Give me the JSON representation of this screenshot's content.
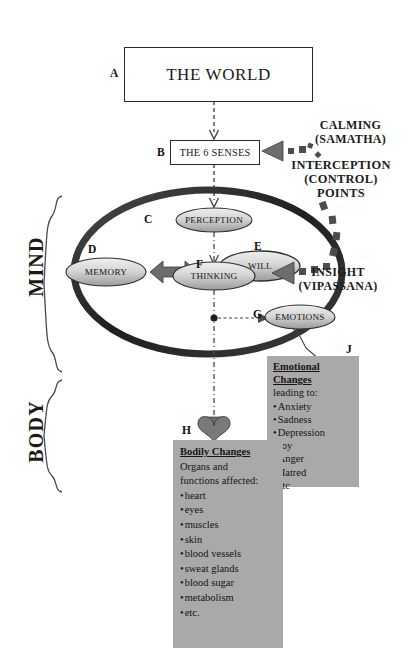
{
  "diagram": {
    "title_box": {
      "tag": "A",
      "label": "THE WORLD"
    },
    "senses_box": {
      "tag": "B",
      "label": "THE 6 SENSES"
    },
    "mind_nodes": [
      {
        "tag": "C",
        "label": "PERCEPTION"
      },
      {
        "tag": "D",
        "label": "MEMORY"
      },
      {
        "tag": "E",
        "label": "WILL"
      },
      {
        "tag": "F",
        "label": "THINKING"
      },
      {
        "tag": "G",
        "label": "EMOTIONS"
      }
    ],
    "side_brackets": [
      {
        "label": "MIND"
      },
      {
        "label": "BODY"
      }
    ],
    "right_labels": {
      "calming": "CALMING\n(SAMATHA)",
      "calming_line1": "CALMING",
      "calming_line2": "(SAMATHA)",
      "interception_line1": "INTERCEPTION",
      "interception_line2": "(CONTROL)",
      "interception_line3": "POINTS",
      "insight_line1": "INSIGHT",
      "insight_line2": "(VIPASSANA)"
    },
    "bodily_panel": {
      "tag": "H",
      "heading": "Bodily Changes",
      "subheading_line1": "Organs and",
      "subheading_line2": "functions affected:",
      "items": [
        "heart",
        "eyes",
        "muscles",
        "skin",
        "blood vessels",
        "sweat glands",
        "blood sugar",
        "metabolism",
        "etc."
      ]
    },
    "emotional_panel": {
      "tag": "J",
      "heading_line1": "Emotional",
      "heading_line2": "Changes",
      "subheading": "leading to:",
      "items": [
        "Anxiety",
        "Sadness",
        "Depression",
        "Joy",
        "Anger",
        "Hatred",
        "etc"
      ]
    },
    "colors": {
      "panel_fill": "#a9a9a9",
      "ring_stroke": "#2b2b2b",
      "node_fill_light": "#e9e9e9",
      "node_fill_dark": "#9a9a9a",
      "arrow_gray": "#6e6e6e",
      "text": "#141414"
    }
  }
}
